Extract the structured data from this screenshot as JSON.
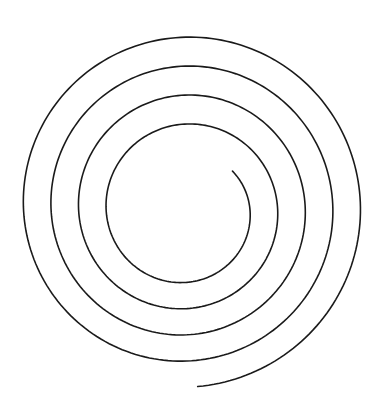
{
  "figure": {
    "type": "archimedean-spiral",
    "stroke_color": "#1a1a1a",
    "background": "#ffffff",
    "stroke_width": 1.6,
    "center": [
      185,
      205
    ],
    "inner_radius": 62,
    "outer_radius": 182,
    "turns": 4.35,
    "start_angle_deg": 40,
    "center_drift": [
      0,
      6
    ]
  }
}
